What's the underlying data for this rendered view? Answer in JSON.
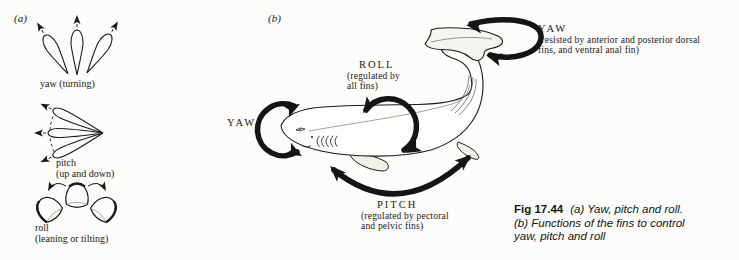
{
  "colors": {
    "paper": "#fcfcfa",
    "ink": "#1b1b1b",
    "fin_fill": "#f1f1ea"
  },
  "panel_a": {
    "label": "(a)",
    "yaw_caption": "yaw (turning)",
    "pitch_caption_1": "pitch",
    "pitch_caption_2": "(up and down)",
    "roll_caption_1": "roll",
    "roll_caption_2": "(leaning or tilting)"
  },
  "panel_b": {
    "label": "(b)",
    "yaw_head_title": "YAW",
    "roll_title": "ROLL",
    "roll_sub_1": "(regulated by",
    "roll_sub_2": "all fins)",
    "yaw_tail_title": "YAW",
    "yaw_tail_sub_1": "(resisted by anterior and posterior dorsal",
    "yaw_tail_sub_2": "fins, and ventral anal fin)",
    "pitch_title": "PITCH",
    "pitch_sub_1": "(regulated by pectoral",
    "pitch_sub_2": "and pelvic fins)"
  },
  "caption": {
    "fig_label": "Fig 17.44",
    "line_1": "(a) Yaw, pitch and roll.",
    "line_2": "(b) Functions of the fins to control",
    "line_3": "yaw, pitch and roll"
  }
}
